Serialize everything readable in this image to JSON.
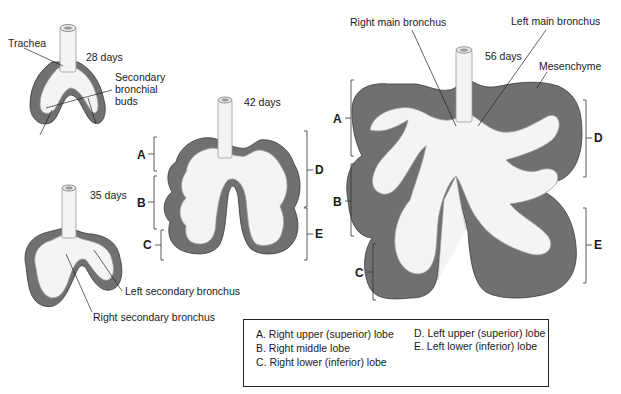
{
  "stages": [
    {
      "id": "28",
      "label": "28 days",
      "annotations": [
        "Trachea",
        "Secondary bronchial buds"
      ]
    },
    {
      "id": "35",
      "label": "35 days",
      "annotations": [
        "Left secondary bronchus",
        "Right secondary bronchus"
      ]
    },
    {
      "id": "42",
      "label": "42 days",
      "lobe_markers": [
        "A",
        "B",
        "C",
        "D",
        "E"
      ]
    },
    {
      "id": "56",
      "label": "56 days",
      "annotations": [
        "Right main bronchus",
        "Left main bronchus",
        "Mesenchyme"
      ],
      "lobe_markers": [
        "A",
        "B",
        "C",
        "D",
        "E"
      ]
    }
  ],
  "labels": {
    "trachea": "Trachea",
    "days28": "28 days",
    "sec_buds_1": "Secondary",
    "sec_buds_2": "bronchial",
    "sec_buds_3": "buds",
    "days35": "35 days",
    "left_sec": "Left secondary bronchus",
    "right_sec": "Right secondary bronchus",
    "days42": "42 days",
    "days56": "56 days",
    "right_main": "Right main bronchus",
    "left_main": "Left main bronchus",
    "mesenchyme": "Mesenchyme"
  },
  "letters": {
    "A": "A",
    "B": "B",
    "C": "C",
    "D": "D",
    "E": "E"
  },
  "legend": {
    "items": [
      "A.  Right upper (superior) lobe",
      "B.  Right middle lobe",
      "C.  Right lower (inferior) lobe",
      "D.  Left upper (superior) lobe",
      "E.  Left lower (inferior) lobe"
    ]
  },
  "colors": {
    "mesenchyme": "#6e6e6e",
    "epithelium": "#f2f2f2",
    "outline": "#3a3a3a"
  }
}
